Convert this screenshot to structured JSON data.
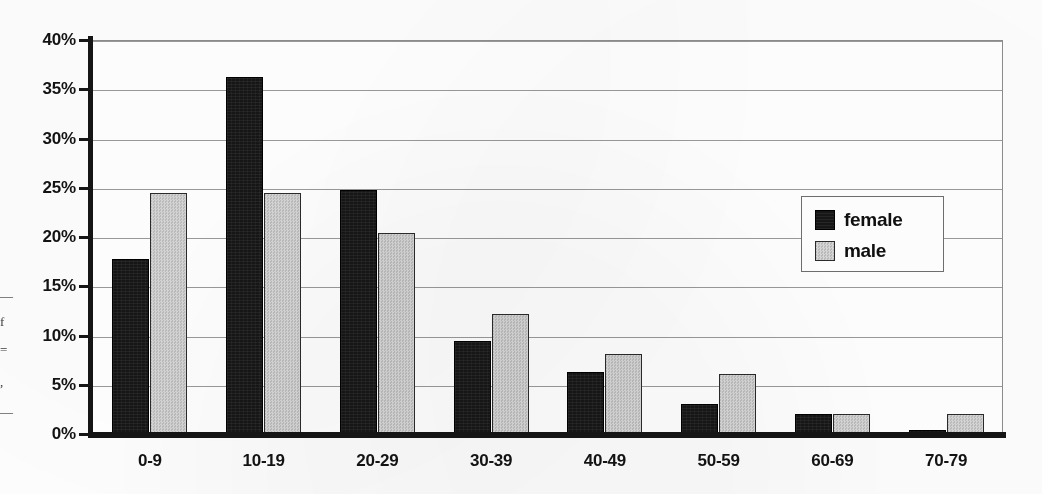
{
  "chart_data": {
    "type": "bar",
    "title": "",
    "xlabel": "",
    "ylabel": "",
    "categories": [
      "0-9",
      "10-19",
      "20-29",
      "30-39",
      "40-49",
      "50-59",
      "60-69",
      "70-79"
    ],
    "series": [
      {
        "name": "female",
        "color": "#161616",
        "values": [
          17.8,
          36.2,
          24.8,
          9.4,
          6.3,
          3.0,
          2.0,
          0.4
        ]
      },
      {
        "name": "male",
        "color": "#c9c9c9",
        "values": [
          24.5,
          24.5,
          20.4,
          12.2,
          8.1,
          6.1,
          2.0,
          2.0
        ]
      }
    ],
    "ylim": [
      0,
      40
    ],
    "ytick_values": [
      0,
      5,
      10,
      15,
      20,
      25,
      30,
      35,
      40
    ],
    "ytick_labels": [
      "0%",
      "5%",
      "10%",
      "15%",
      "20%",
      "25%",
      "30%",
      "35%",
      "40%"
    ],
    "grid": true,
    "legend_position": "upper right",
    "value_unit": "%"
  },
  "legend": {
    "items": [
      {
        "label": "female",
        "swatch": "female"
      },
      {
        "label": "male",
        "swatch": "male"
      }
    ]
  },
  "cropped_caption_fragments": [
    "—",
    "f",
    "=",
    ",",
    "—"
  ]
}
